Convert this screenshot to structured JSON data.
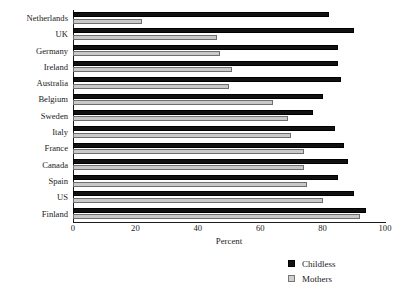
{
  "chart_data": {
    "type": "bar",
    "orientation": "horizontal",
    "title": "",
    "xlabel": "Percent",
    "ylabel": "",
    "xlim": [
      0,
      100
    ],
    "xticks": [
      0,
      20,
      40,
      60,
      80,
      100
    ],
    "grid": false,
    "legend_position": "bottom-right",
    "categories": [
      "Netherlands",
      "UK",
      "Germany",
      "Ireland",
      "Australia",
      "Belgium",
      "Sweden",
      "Italy",
      "France",
      "Canada",
      "Spain",
      "US",
      "Finland"
    ],
    "series": [
      {
        "name": "Childless",
        "color": "#111111",
        "values": [
          82,
          90,
          85,
          85,
          86,
          80,
          77,
          84,
          87,
          88,
          85,
          90,
          94
        ]
      },
      {
        "name": "Mothers",
        "color": "#c9c9c9",
        "values": [
          22,
          46,
          47,
          51,
          50,
          64,
          69,
          70,
          74,
          74,
          75,
          80,
          92
        ]
      }
    ]
  },
  "legend": {
    "items": [
      {
        "label": "Childless",
        "swatch": "childless"
      },
      {
        "label": "Mothers",
        "swatch": "mothers"
      }
    ]
  }
}
